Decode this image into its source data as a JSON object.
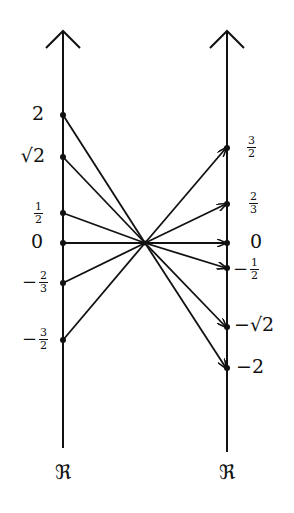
{
  "diagram": {
    "center": {
      "x": 145,
      "y": 243
    },
    "left_axis": {
      "label": "ℜ",
      "x": 63,
      "points": [
        {
          "id": "2",
          "kind": "int",
          "text": "2",
          "y": 115
        },
        {
          "id": "sqrt2",
          "kind": "sqrt",
          "text": "√2",
          "y": 157
        },
        {
          "id": "half",
          "kind": "frac",
          "sign": "",
          "num": "1",
          "den": "2",
          "y": 213
        },
        {
          "id": "zero",
          "kind": "int",
          "text": "0",
          "y": 243
        },
        {
          "id": "neg-two-thirds",
          "kind": "frac",
          "sign": "−",
          "num": "2",
          "den": "3",
          "y": 283
        },
        {
          "id": "neg-three-halves",
          "kind": "frac",
          "sign": "−",
          "num": "3",
          "den": "2",
          "y": 340
        }
      ]
    },
    "right_axis": {
      "label": "ℜ",
      "x": 227,
      "points": [
        {
          "id": "three-halves",
          "kind": "frac",
          "sign": "",
          "num": "3",
          "den": "2",
          "y": 148
        },
        {
          "id": "two-thirds",
          "kind": "frac",
          "sign": "",
          "num": "2",
          "den": "3",
          "y": 204
        },
        {
          "id": "zero",
          "kind": "int",
          "text": "0",
          "y": 243
        },
        {
          "id": "neg-half",
          "kind": "frac",
          "sign": "−",
          "num": "1",
          "den": "2",
          "y": 268
        },
        {
          "id": "neg-sqrt2",
          "kind": "sqrt",
          "text": "−√2",
          "y": 327
        },
        {
          "id": "neg-2",
          "kind": "int",
          "text": "−2",
          "y": 368
        }
      ]
    },
    "mappings": [
      {
        "from": "2",
        "to": "−2"
      },
      {
        "from": "√2",
        "to": "−√2"
      },
      {
        "from": "1/2",
        "to": "−1/2"
      },
      {
        "from": "0",
        "to": "0"
      },
      {
        "from": "−2/3",
        "to": "2/3"
      },
      {
        "from": "−3/2",
        "to": "3/2"
      }
    ],
    "colors": {
      "ink": "#111111",
      "background": "#ffffff"
    }
  }
}
